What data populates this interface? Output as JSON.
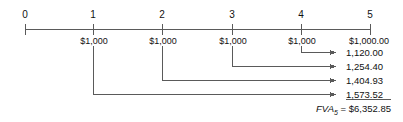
{
  "diagram": {
    "type": "timeline-future-value-annuity",
    "title": "",
    "axis": {
      "name": "time-line",
      "periods": [
        {
          "label": "0",
          "x": 25
        },
        {
          "label": "1",
          "x": 93
        },
        {
          "label": "2",
          "x": 162
        },
        {
          "label": "3",
          "x": 232
        },
        {
          "label": "4",
          "x": 301
        },
        {
          "label": "5",
          "x": 370
        }
      ]
    },
    "cash_flows": [
      {
        "period": 1,
        "label": "$1,000",
        "x": 93
      },
      {
        "period": 2,
        "label": "$1,000",
        "x": 162
      },
      {
        "period": 3,
        "label": "$1,000",
        "x": 232
      },
      {
        "period": 4,
        "label": "$1,000",
        "x": 301
      },
      {
        "period": 5,
        "label": "$1,000.00",
        "x": 370
      }
    ],
    "future_values": [
      {
        "from_period": 4,
        "value": "1,120.00",
        "underline": false
      },
      {
        "from_period": 3,
        "value": "1,254.40",
        "underline": false
      },
      {
        "from_period": 2,
        "value": "1,404.93",
        "underline": false
      },
      {
        "from_period": 1,
        "value": "1,573.52",
        "underline": true
      }
    ],
    "total": {
      "symbol": "FVA",
      "subscript": "5",
      "equals": "=",
      "amount": "$6,352.85",
      "full_text": "FVA5 = $6,352.85"
    },
    "colors": {
      "line": "#5a5a5a",
      "text": "#111111",
      "background": "#ffffff"
    }
  }
}
